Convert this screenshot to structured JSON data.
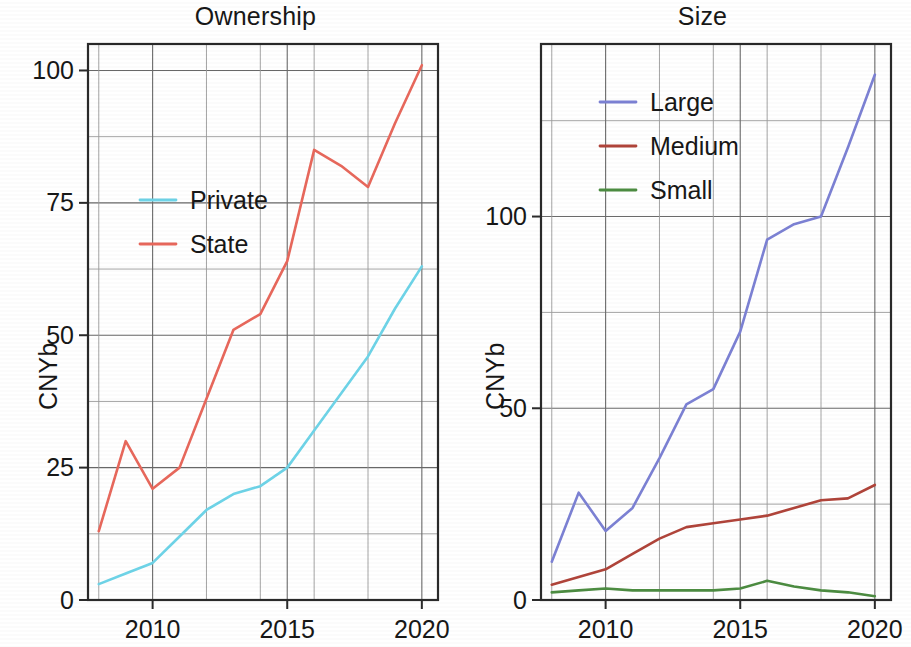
{
  "figure": {
    "panels": [
      {
        "id": "ownership",
        "title": "Ownership",
        "ylabel": "CNYb",
        "xlabel": "",
        "y_ticks": [
          "0",
          "25",
          "50",
          "75",
          "100"
        ],
        "x_ticks": [
          "2010",
          "2015",
          "2020"
        ],
        "legend": [
          {
            "label": "Private",
            "color": "#6ED4E8"
          },
          {
            "label": "State",
            "color": "#E8685C"
          }
        ]
      },
      {
        "id": "size",
        "title": "Size",
        "ylabel": "CNYb",
        "xlabel": "",
        "y_ticks": [
          "0",
          "50",
          "100"
        ],
        "x_ticks": [
          "2010",
          "2015",
          "2020"
        ],
        "legend": [
          {
            "label": "Large",
            "color": "#7C81D4"
          },
          {
            "label": "Medium",
            "color": "#B0443A"
          },
          {
            "label": "Small",
            "color": "#4C8C41"
          }
        ]
      }
    ]
  },
  "chart_data": [
    {
      "type": "line",
      "title": "Ownership",
      "xlabel": "",
      "ylabel": "CNYb",
      "x": [
        2008,
        2009,
        2010,
        2011,
        2012,
        2013,
        2014,
        2015,
        2016,
        2017,
        2018,
        2019,
        2020
      ],
      "xlim": [
        2007.6,
        2020.6
      ],
      "ylim": [
        0,
        105
      ],
      "x_ticks": [
        2010,
        2015,
        2020
      ],
      "y_ticks": [
        0,
        25,
        50,
        75,
        100
      ],
      "y_minor_step": 12.5,
      "grid": true,
      "legend_position": "upper-left-inside",
      "series": [
        {
          "name": "Private",
          "color": "#6ED4E8",
          "values": [
            3,
            5,
            7,
            12,
            17,
            20,
            21.5,
            25,
            32,
            39,
            46,
            55,
            63
          ]
        },
        {
          "name": "State",
          "color": "#E8685C",
          "values": [
            13,
            30,
            21,
            25,
            38,
            51,
            54,
            64,
            85,
            82,
            78,
            90,
            101
          ]
        }
      ]
    },
    {
      "type": "line",
      "title": "Size",
      "xlabel": "",
      "ylabel": "CNYb",
      "x": [
        2008,
        2009,
        2010,
        2011,
        2012,
        2013,
        2014,
        2015,
        2016,
        2017,
        2018,
        2019,
        2020
      ],
      "xlim": [
        2007.6,
        2020.6
      ],
      "ylim": [
        0,
        145
      ],
      "x_ticks": [
        2010,
        2015,
        2020
      ],
      "y_ticks": [
        0,
        50,
        100
      ],
      "y_minor_step": 25,
      "grid": true,
      "legend_position": "upper-left-inside",
      "series": [
        {
          "name": "Large",
          "color": "#7C81D4",
          "values": [
            10,
            28,
            18,
            24,
            37,
            51,
            55,
            70,
            94,
            98,
            100,
            118,
            137
          ]
        },
        {
          "name": "Medium",
          "color": "#B0443A",
          "values": [
            4,
            6,
            8,
            12,
            16,
            19,
            20,
            21,
            22,
            24,
            26,
            26.5,
            30
          ]
        },
        {
          "name": "Small",
          "color": "#4C8C41",
          "values": [
            2,
            2.5,
            3,
            2.5,
            2.5,
            2.5,
            2.5,
            3,
            5,
            3.5,
            2.5,
            2,
            1
          ]
        }
      ]
    }
  ]
}
